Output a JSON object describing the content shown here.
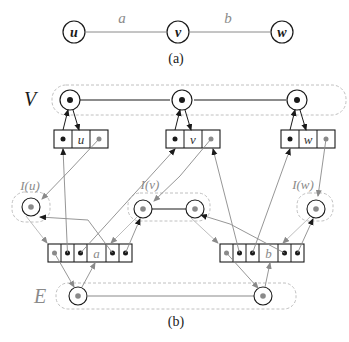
{
  "colors": {
    "black": "#1a1a1a",
    "gray": "#8a8a8a",
    "light": "#b5b5b5",
    "dash": "#c0c0c0"
  },
  "part_a": {
    "caption": "(a)",
    "vertices": [
      {
        "id": "u",
        "label": "u"
      },
      {
        "id": "v",
        "label": "v"
      },
      {
        "id": "w",
        "label": "w"
      }
    ],
    "edges": [
      {
        "id": "a",
        "label": "a",
        "from": "u",
        "to": "v"
      },
      {
        "id": "b",
        "label": "b",
        "from": "v",
        "to": "w"
      }
    ]
  },
  "part_b": {
    "caption": "(b)",
    "layer_V_label": "V",
    "layer_E_label": "E",
    "vertex_records": [
      {
        "id": "u",
        "label": "u"
      },
      {
        "id": "v",
        "label": "v"
      },
      {
        "id": "w",
        "label": "w"
      }
    ],
    "incidence_labels": [
      {
        "id": "Iu",
        "label": "I(u)"
      },
      {
        "id": "Iv",
        "label": "I(v)"
      },
      {
        "id": "Iw",
        "label": "I(w)"
      }
    ],
    "edge_records": [
      {
        "id": "a",
        "label": "a"
      },
      {
        "id": "b",
        "label": "b"
      }
    ]
  }
}
